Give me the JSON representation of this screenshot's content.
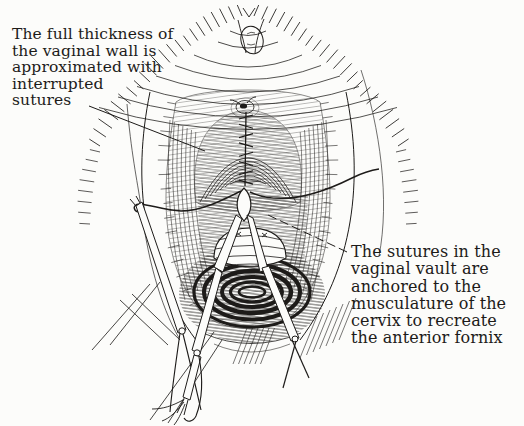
{
  "figure": {
    "type": "medical-line-illustration",
    "paper_color": "#fcfcfa",
    "ink_color": "#1d1b19",
    "annotations": {
      "left": {
        "lines": [
          "The full thickness of",
          "the vaginal wall is",
          "approximated with",
          "interrupted",
          "sutures"
        ]
      },
      "right": {
        "lines": [
          "The sutures in the",
          "vaginal vault are",
          "anchored to the",
          "musculature of the",
          "cervix to recreate",
          "the anterior fornix"
        ]
      }
    }
  }
}
